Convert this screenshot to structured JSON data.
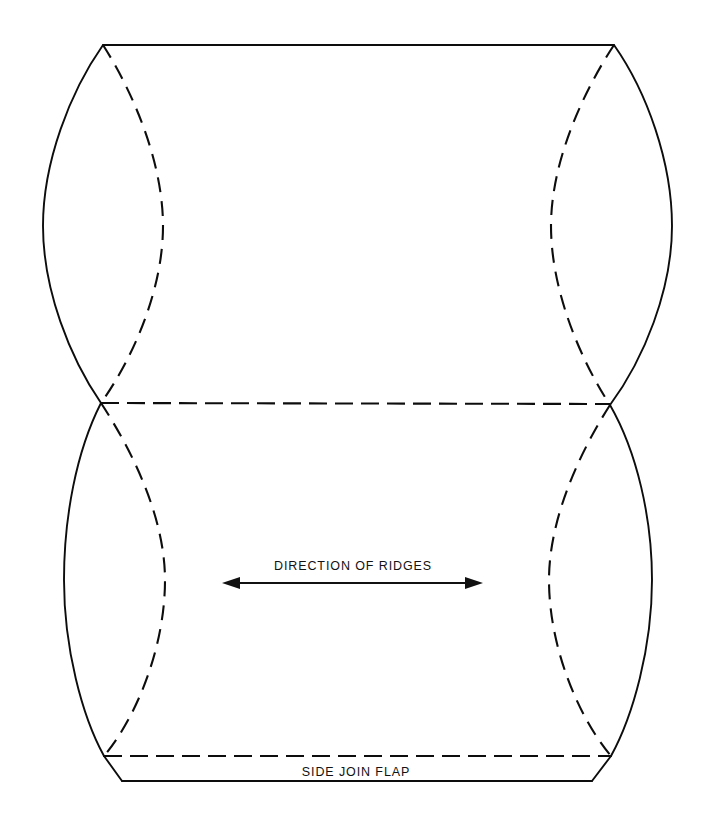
{
  "document": {
    "title": "Packaging Dieline Diagram",
    "background_color": "#ffffff",
    "line_color": "#0d0d0d",
    "width": 706,
    "height": 828
  },
  "labels": {
    "direction_of_ridges": "DIRECTION OF  RIDGES",
    "side_join_flap": "SIDE JOIN FLAP"
  },
  "annotations": {
    "ridge_arrow": {
      "type": "double-headed-arrow",
      "x_start": 222,
      "x_end": 483,
      "y": 583
    }
  },
  "geometry": {
    "corner_top_left": [
      103,
      45
    ],
    "corner_top_right": [
      614,
      45
    ],
    "waist_left": [
      101,
      403
    ],
    "waist_right": [
      610,
      405
    ],
    "corner_bottom_left": [
      104,
      756
    ],
    "corner_bottom_right": [
      611,
      756
    ],
    "flap_bottom_left": [
      122,
      781
    ],
    "flap_bottom_right": [
      592,
      781
    ],
    "upper_left_bulge_x": 43,
    "upper_right_bulge_x": 672,
    "lower_left_bulge_x": 64,
    "lower_right_bulge_x": 652,
    "upper_dashed_left_bulge_x": 163,
    "upper_dashed_right_bulge_x": 551,
    "lower_dashed_left_bulge_x": 165,
    "lower_dashed_right_bulge_x": 549,
    "dash_pattern": "18 8"
  },
  "fold_lines": {
    "top_edge": {
      "style": "solid",
      "y": 45,
      "x_start": 103,
      "x_end": 614
    },
    "middle_score": {
      "style": "dashed",
      "y": 403,
      "x_start": 101,
      "x_end": 610
    },
    "flap_score": {
      "style": "dashed",
      "y": 756,
      "x_start": 104,
      "x_end": 611
    },
    "flap_edge": {
      "style": "solid",
      "y": 781,
      "x_start": 122,
      "x_end": 592
    }
  }
}
